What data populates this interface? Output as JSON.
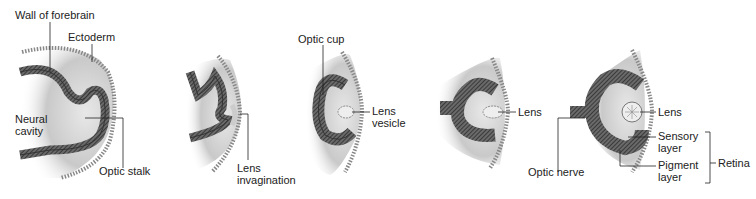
{
  "diagram": {
    "type": "embryology sequence - eye development",
    "stages": [
      {
        "id": 1,
        "labels": [
          "Wall of forebrain",
          "Ectoderm",
          "Neural cavity",
          "Optic stalk"
        ]
      },
      {
        "id": 2,
        "labels": [
          "Lens invagination"
        ]
      },
      {
        "id": 3,
        "labels": [
          "Optic cup",
          "Lens vesicle"
        ]
      },
      {
        "id": 4,
        "labels": [
          "Lens",
          "Optic nerve"
        ]
      },
      {
        "id": 5,
        "labels": [
          "Lens",
          "Sensory layer",
          "Pigment layer",
          "Retina"
        ]
      }
    ]
  },
  "labels": {
    "wall_of_forebrain": "Wall of forebrain",
    "ectoderm": "Ectoderm",
    "neural_line1": "Neural",
    "neural_line2": "cavity",
    "optic_stalk": "Optic stalk",
    "lens_inv_line1": "Lens",
    "lens_inv_line2": "invagination",
    "optic_cup": "Optic cup",
    "lens_ves_line1": "Lens",
    "lens_ves_line2": "vesicle",
    "lens4": "Lens",
    "optic_nerve": "Optic nerve",
    "lens5": "Lens",
    "sensory_line1": "Sensory",
    "sensory_line2": "layer",
    "pigment_line1": "Pigment",
    "pigment_line2": "layer",
    "retina": "Retina"
  },
  "colors": {
    "tissue_dark": "#3a3a3a",
    "tissue_mid": "#7a7a7a",
    "shading": "#b8b8b8",
    "text": "#222222"
  }
}
